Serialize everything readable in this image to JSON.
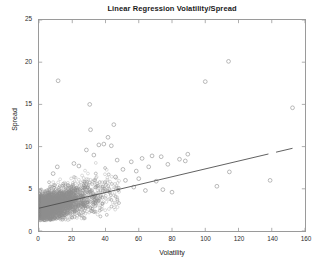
{
  "chart": {
    "title": "Linear Regression Volatility/Spread",
    "xlabel": "Volatility",
    "ylabel": "Spread"
  },
  "colors": {
    "marker": "#8c8c8c",
    "line": "#4d4d4d",
    "axis": "#9a9a9a",
    "text": "#1a1a1a",
    "background": "#ffffff"
  },
  "chart_data": {
    "type": "scatter",
    "title": "Linear Regression Volatility/Spread",
    "xlabel": "Volatility",
    "ylabel": "Spread",
    "xlim": [
      0,
      160
    ],
    "ylim": [
      0,
      25
    ],
    "xticks": [
      0,
      20,
      40,
      60,
      80,
      100,
      120,
      140,
      160
    ],
    "yticks": [
      0,
      5,
      10,
      15,
      20,
      25
    ],
    "grid": false,
    "legend": false,
    "marker": "open-circle",
    "marker_color": "#8c8c8c",
    "series": [
      {
        "name": "Volatility vs Spread",
        "type": "scatter",
        "n_points_approx": 4000,
        "description": "Dense cloud of open circles concentrated at low volatility (0-60) with spread 1.5-6, thinning out toward high volatility with scattered outliers",
        "notable_points": [
          [
            11.5,
            17.8
          ],
          [
            100.0,
            17.7
          ],
          [
            114.0,
            20.1
          ],
          [
            152.5,
            14.6
          ],
          [
            31.0,
            12.0
          ],
          [
            45.0,
            12.6
          ],
          [
            30.5,
            15.0
          ],
          [
            41.5,
            11.1
          ],
          [
            36.0,
            10.2
          ],
          [
            43.5,
            10.1
          ],
          [
            39.0,
            10.3
          ],
          [
            28.5,
            9.6
          ],
          [
            33.0,
            9.0
          ],
          [
            11.0,
            7.6
          ],
          [
            8.5,
            6.8
          ],
          [
            21.0,
            8.0
          ],
          [
            24.0,
            7.7
          ],
          [
            47.0,
            8.4
          ],
          [
            55.5,
            8.2
          ],
          [
            62.0,
            8.6
          ],
          [
            68.0,
            8.9
          ],
          [
            73.5,
            8.8
          ],
          [
            84.5,
            8.5
          ],
          [
            89.5,
            9.1
          ],
          [
            88.0,
            8.3
          ],
          [
            77.5,
            7.9
          ],
          [
            66.0,
            7.6
          ],
          [
            58.5,
            7.1
          ],
          [
            50.5,
            7.3
          ],
          [
            60.0,
            6.2
          ],
          [
            70.5,
            5.9
          ],
          [
            80.0,
            4.6
          ],
          [
            74.5,
            4.9
          ],
          [
            107.0,
            5.3
          ],
          [
            114.5,
            7.0
          ],
          [
            139.0,
            6.0
          ],
          [
            64.0,
            4.8
          ],
          [
            57.0,
            5.2
          ],
          [
            52.0,
            6.0
          ],
          [
            46.0,
            6.4
          ]
        ]
      },
      {
        "name": "Linear regression fit",
        "type": "line",
        "style": "solid-with-dash-gap",
        "endpoints": [
          [
            0,
            2.7
          ],
          [
            152.5,
            9.8
          ]
        ],
        "slope": 0.0466,
        "intercept": 2.7
      }
    ]
  },
  "axes": {
    "x_tick_labels": [
      "0",
      "20",
      "40",
      "60",
      "80",
      "100",
      "120",
      "140",
      "160"
    ],
    "y_tick_labels": [
      "0",
      "5",
      "10",
      "15",
      "20",
      "25"
    ]
  }
}
